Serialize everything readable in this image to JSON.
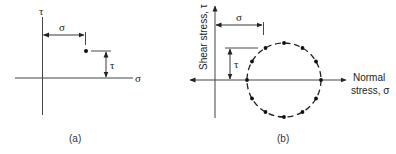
{
  "panel_a": {
    "caption": "(a)",
    "y_axis_label": "τ",
    "x_axis_label": "σ",
    "sigma_dim_label": "σ",
    "tau_dim_label": "τ"
  },
  "panel_b": {
    "caption": "(b)",
    "y_axis_label": "Shear stress, τ",
    "x_axis_label_line1": "Normal",
    "x_axis_label_line2": "stress, σ",
    "sigma_dim_label": "σ",
    "tau_dim_label": "τ",
    "circle_dot_count": 12
  },
  "colors": {
    "line": "#333333",
    "dot": "#111111"
  }
}
